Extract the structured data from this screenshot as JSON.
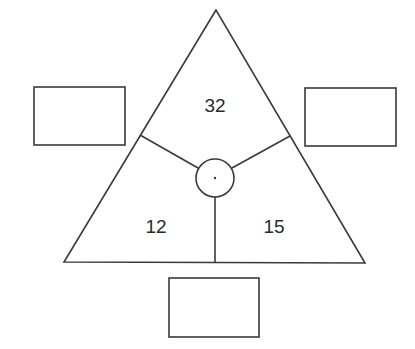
{
  "diagram": {
    "type": "triangle-puzzle",
    "triangle": {
      "sections": [
        {
          "position": "top",
          "value": "32"
        },
        {
          "position": "bottom-left",
          "value": "12"
        },
        {
          "position": "bottom-right",
          "value": "15"
        }
      ],
      "center": {
        "shape": "circle",
        "content": "dot"
      }
    },
    "answer_boxes": [
      {
        "position": "left",
        "value": ""
      },
      {
        "position": "right",
        "value": ""
      },
      {
        "position": "bottom",
        "value": ""
      }
    ],
    "colors": {
      "line": "#3a3a3a",
      "text": "#2a2a2a",
      "background": "#ffffff"
    }
  }
}
